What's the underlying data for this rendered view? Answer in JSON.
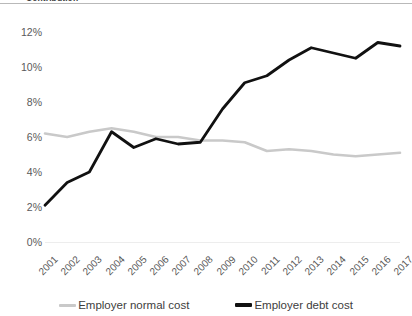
{
  "chart_data": {
    "type": "line",
    "title": "Contribution",
    "xlabel": "",
    "ylabel": "",
    "ylim": [
      0,
      12
    ],
    "ytick_values": [
      0,
      2,
      4,
      6,
      8,
      10,
      12
    ],
    "ytick_labels": [
      "0%",
      "2%",
      "4%",
      "6%",
      "8%",
      "10%",
      "12%"
    ],
    "grid": false,
    "legend_position": "bottom",
    "categories": [
      "2001",
      "2002",
      "2003",
      "2004",
      "2005",
      "2006",
      "2007",
      "2008",
      "2009",
      "2010",
      "2011",
      "2012",
      "2013",
      "2014",
      "2015",
      "2016",
      "2017"
    ],
    "series": [
      {
        "name": "Employer normal cost",
        "color": "#c9c9c9",
        "values": [
          6.2,
          6.0,
          6.3,
          6.5,
          6.3,
          6.0,
          6.0,
          5.8,
          5.8,
          5.7,
          5.2,
          5.3,
          5.2,
          5.0,
          4.9,
          5.0,
          5.1
        ]
      },
      {
        "name": "Employer debt cost",
        "color": "#111111",
        "values": [
          2.1,
          3.4,
          4.0,
          6.3,
          5.4,
          5.9,
          5.6,
          5.7,
          7.6,
          9.1,
          9.5,
          10.4,
          11.1,
          10.8,
          10.5,
          11.4,
          11.2
        ]
      }
    ]
  },
  "legend": {
    "items": [
      {
        "label": "Employer normal cost",
        "color": "#c9c9c9"
      },
      {
        "label": "Employer debt cost",
        "color": "#111111"
      }
    ]
  }
}
